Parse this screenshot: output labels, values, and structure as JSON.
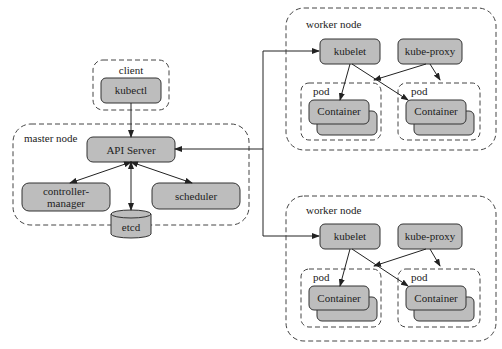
{
  "diagram": {
    "client": {
      "group_label": "client",
      "kubectl": "kubectl"
    },
    "master": {
      "group_label": "master node",
      "api_server": "API Server",
      "controller_manager_line1": "controller-",
      "controller_manager_line2": "manager",
      "scheduler": "scheduler",
      "etcd": "etcd"
    },
    "workers": [
      {
        "group_label": "worker node",
        "kubelet": "kubelet",
        "kube_proxy": "kube-proxy",
        "pods": [
          {
            "label": "pod",
            "container": "Container"
          },
          {
            "label": "pod",
            "container": "Container"
          }
        ]
      },
      {
        "group_label": "worker node",
        "kubelet": "kubelet",
        "kube_proxy": "kube-proxy",
        "pods": [
          {
            "label": "pod",
            "container": "Container"
          },
          {
            "label": "pod",
            "container": "Container"
          }
        ]
      }
    ],
    "colors": {
      "box_fill": "#bdbdbd",
      "stroke": "#333333",
      "background": "#ffffff"
    }
  }
}
